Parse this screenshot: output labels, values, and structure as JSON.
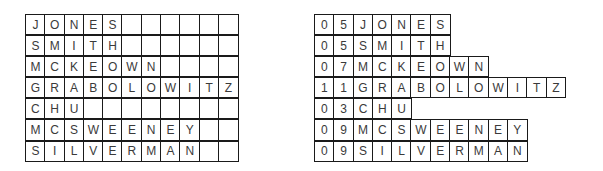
{
  "fixed_length_records": {
    "columns": 11,
    "rows": [
      {
        "name": "JONES"
      },
      {
        "name": "SMITH"
      },
      {
        "name": "MCKEOWN"
      },
      {
        "name": "GRABOLOWITZ"
      },
      {
        "name": "CHU"
      },
      {
        "name": "MCSWEENEY"
      },
      {
        "name": "SILVERMAN"
      }
    ]
  },
  "length_prefixed_records": {
    "rows": [
      {
        "length": "05",
        "name": "JONES"
      },
      {
        "length": "05",
        "name": "SMITH"
      },
      {
        "length": "07",
        "name": "MCKEOWN"
      },
      {
        "length": "11",
        "name": "GRABOLOWITZ"
      },
      {
        "length": "03",
        "name": "CHU"
      },
      {
        "length": "09",
        "name": "MCSWEENEY"
      },
      {
        "length": "09",
        "name": "SILVERMAN"
      }
    ]
  },
  "colors": {
    "grid_line": "#1a1a1a",
    "text": "#3a3a3a",
    "background": "#ffffff"
  }
}
